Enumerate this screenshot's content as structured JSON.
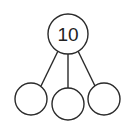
{
  "diagram": {
    "type": "number-bond",
    "root": {
      "label": "10",
      "cx": 68,
      "cy": 34,
      "r": 20
    },
    "children": [
      {
        "label": "",
        "cx": 31,
        "cy": 99,
        "r": 16
      },
      {
        "label": "",
        "cx": 68,
        "cy": 104,
        "r": 16
      },
      {
        "label": "",
        "cx": 104,
        "cy": 99,
        "r": 16
      }
    ],
    "colors": {
      "stroke": "#2a2a2a",
      "fill": "#ffffff"
    }
  }
}
